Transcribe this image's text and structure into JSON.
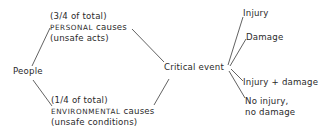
{
  "diagram": {
    "type": "causal-tree",
    "root": {
      "label": "People"
    },
    "causes": [
      {
        "share": "(3/4 of total)",
        "name_caps": "PERSONAL",
        "name_rest": " causes",
        "detail": "(unsafe acts)"
      },
      {
        "share": "(1/4 of total)",
        "name_caps": "ENVIRONMENTAL",
        "name_rest": " causes",
        "detail": "(unsafe conditions)"
      }
    ],
    "event": {
      "label": "Critical event"
    },
    "outcomes": [
      {
        "label": "Injury"
      },
      {
        "label": "Damage"
      },
      {
        "label": "Injury + damage"
      },
      {
        "label_line1": "No injury,",
        "label_line2": "no damage"
      }
    ],
    "edges": [
      [
        "People",
        "PERSONAL causes"
      ],
      [
        "People",
        "ENVIRONMENTAL causes"
      ],
      [
        "PERSONAL causes",
        "Critical event"
      ],
      [
        "ENVIRONMENTAL causes",
        "Critical event"
      ],
      [
        "Critical event",
        "Injury"
      ],
      [
        "Critical event",
        "Damage"
      ],
      [
        "Critical event",
        "Injury + damage"
      ],
      [
        "Critical event",
        "No injury, no damage"
      ]
    ]
  }
}
